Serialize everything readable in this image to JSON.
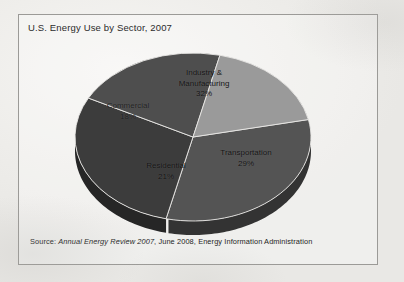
{
  "figure": {
    "title": "U.S. Energy Use by Sector, 2007",
    "source_prefix": "Source:",
    "source_publication": "Annual Energy Review 2007",
    "source_rest": ", June 2008, Energy Information Administration",
    "frame_border_color": "#9b9a97",
    "background_color": "#efeeec"
  },
  "chart_data": {
    "type": "pie",
    "title": "U.S. Energy Use by Sector, 2007",
    "xlabel": "",
    "ylabel": "",
    "units": "percent of total U.S. energy use",
    "three_d": true,
    "grid": false,
    "legend": "none (labels inside slices)",
    "start_angle_deg": 348,
    "direction": "clockwise",
    "total": 100,
    "categories": [
      "Industry & Manufacturing",
      "Transportation",
      "Residential",
      "Commercial"
    ],
    "values": [
      32,
      29,
      21,
      18
    ],
    "slices": [
      {
        "label_line1": "Industry &",
        "label_line2": "Manufacturing",
        "name": "Industry & Manufacturing",
        "value": 32,
        "pct_text": "32%",
        "color": "#545454",
        "side_color": "#333333"
      },
      {
        "label_line1": "Transportation",
        "label_line2": "",
        "name": "Transportation",
        "value": 29,
        "pct_text": "29%",
        "color": "#3c3c3c",
        "side_color": "#262626"
      },
      {
        "label_line1": "Residential",
        "label_line2": "",
        "name": "Residential",
        "value": 21,
        "pct_text": "21%",
        "color": "#4e4e4e",
        "side_color": "#303030"
      },
      {
        "label_line1": "Commercial",
        "label_line2": "",
        "name": "Commercial",
        "value": 18,
        "pct_text": "18%",
        "color": "#9a9a9a",
        "side_color": "#6a6a6a"
      }
    ]
  }
}
